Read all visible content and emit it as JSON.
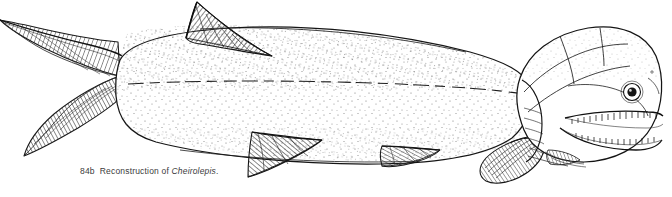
{
  "figure": {
    "number": "84b",
    "caption_text": "Reconstruction of",
    "taxon_name": "Cheirolepis",
    "caption_terminator": ".",
    "full_caption": "84b  Reconstruction of Cheirolepis.",
    "medium": "pen-and-ink line drawing with stipple shading",
    "orientation": "lateral view, head at right, tail at left",
    "background_color": "#ffffff",
    "ink_color": "#1a1a1a",
    "stipple_color": "#4a4a4a"
  },
  "anatomy": {
    "parts": [
      {
        "name": "caudal-fin",
        "label": "Heterocercal caudal fin",
        "note": "upper lobe elongate, extends to left edge"
      },
      {
        "name": "dorsal-fin",
        "label": "Dorsal fin",
        "note": "single triangular fin, dense diagonal ray hatching"
      },
      {
        "name": "anal-fin",
        "label": "Anal fin",
        "note": "large triangular ventral fin with ray hatching"
      },
      {
        "name": "pelvic-fin",
        "label": "Pelvic fin",
        "note": "low elongate fin on ventral margin"
      },
      {
        "name": "pectoral-fin",
        "label": "Pectoral fin",
        "note": "rounded paddle-shaped fin behind head"
      },
      {
        "name": "head",
        "label": "Head",
        "note": "bony dermal plates, large orbit"
      },
      {
        "name": "eye",
        "label": "Orbit and eye",
        "note": "large circular eye with dark pupil"
      },
      {
        "name": "jaws",
        "label": "Jaws with teeth",
        "note": "rows of small conical teeth on upper and lower jaws"
      },
      {
        "name": "operculum",
        "label": "Opercular series",
        "note": "gill cover plates behind the eye"
      },
      {
        "name": "lateral-line",
        "label": "Lateral line",
        "note": "horizontal line running along mid-flank"
      },
      {
        "name": "scale-rows",
        "label": "Scale rows",
        "note": "fine stippled oblique rows covering the body"
      }
    ]
  }
}
